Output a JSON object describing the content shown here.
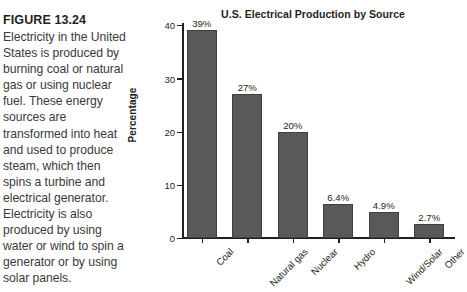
{
  "figure": {
    "label": "FIGURE 13.24",
    "caption": "Electricity in the United States is produced by burning coal or natural gas or using nuclear fuel. These energy sources are transformed into heat and used to produce steam, which then spins a turbine and electrical generator. Electricity is also produced by using water or wind to spin a generator or by using solar panels."
  },
  "chart_data": {
    "type": "bar",
    "title": "U.S. Electrical Production by Source",
    "xlabel": "",
    "ylabel": "Percentage",
    "ylim": [
      0,
      40
    ],
    "yticks": [
      "0",
      "10",
      "20",
      "30",
      "40"
    ],
    "ytick_values": [
      0,
      10,
      20,
      30,
      40
    ],
    "grid": false,
    "legend": "none",
    "categories": [
      "Coal",
      "Natural gas",
      "Nuclear",
      "Hydro",
      "Wind/Solar",
      "Other"
    ],
    "values": [
      39,
      27,
      20,
      6.4,
      4.9,
      2.7
    ],
    "data_labels": [
      "39%",
      "27%",
      "20%",
      "6.4%",
      "4.9%",
      "2.7%"
    ],
    "bar_color": "#595959",
    "bar_edge_color": "#3f3f3f",
    "background_color": "#ffffff"
  }
}
